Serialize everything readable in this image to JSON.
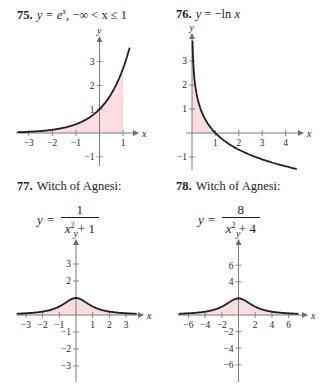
{
  "problems": [
    {
      "number": "75.",
      "title": "y = e^x,  −∞ < x ≤ 1",
      "title_parts": {
        "lhs": "y = e",
        "sup": "x",
        "rest": ",   −∞ < x ≤ 1"
      }
    },
    {
      "number": "76.",
      "title": "y = −ln x",
      "title_parts": {
        "lhs": "y",
        "rest": " = −ln ",
        "var": "x"
      }
    },
    {
      "number": "77.",
      "title": "Witch of Agnesi:",
      "formula": {
        "lhs": "y =",
        "numerator": "1",
        "denominator_var": "x",
        "denominator_rest": " + 1"
      }
    },
    {
      "number": "78.",
      "title": "Witch of Agnesi:",
      "formula": {
        "lhs": "y =",
        "numerator": "8",
        "denominator_var": "x",
        "denominator_rest": " + 4"
      }
    }
  ],
  "axis_labels": {
    "x": "x",
    "y": "y"
  },
  "colors": {
    "curve": "#231f20",
    "shade": "#f9dde0",
    "axis": "#6d6e71"
  },
  "chart_data": [
    {
      "type": "line",
      "title": "75. y = e^x, −∞ < x ≤ 1",
      "function": "exp(x)",
      "xlabel": "x",
      "ylabel": "y",
      "x_ticks": [
        -3,
        -2,
        -1,
        1
      ],
      "y_ticks": [
        -1,
        1,
        2,
        3
      ],
      "xlim": [
        -3.5,
        1.4
      ],
      "ylim": [
        -1.5,
        3.8
      ],
      "shaded_region": {
        "from_x": "-inf",
        "to_x": 1,
        "between": "curve and x-axis"
      },
      "curve_x_range": [
        -3.4,
        1.25
      ],
      "grid": false
    },
    {
      "type": "line",
      "title": "76. y = −ln x",
      "function": "-ln(x)",
      "xlabel": "x",
      "ylabel": "y",
      "x_ticks": [
        1,
        2,
        3,
        4
      ],
      "y_ticks": [
        -1,
        1,
        2,
        3
      ],
      "xlim": [
        0,
        4.7
      ],
      "ylim": [
        -1.6,
        3.8
      ],
      "shaded_region": {
        "from_x": 0,
        "to_x": 1,
        "between": "curve and x-axis"
      },
      "curve_x_range": [
        0.025,
        4.5
      ],
      "grid": false
    },
    {
      "type": "line",
      "title": "77. Witch of Agnesi: y = 1/(x^2 + 1)",
      "function": "1/(x^2+1)",
      "xlabel": "x",
      "ylabel": "y",
      "x_ticks": [
        -3,
        -2,
        -1,
        1,
        2,
        3
      ],
      "y_ticks": [
        -3,
        -2,
        -1,
        2,
        3
      ],
      "xlim": [
        -3.5,
        3.8
      ],
      "ylim": [
        -3.5,
        3.8
      ],
      "peak": {
        "x": 0,
        "y": 1
      },
      "shaded_region": {
        "from_x": "-inf",
        "to_x": "inf",
        "between": "curve and x-axis"
      },
      "grid": false
    },
    {
      "type": "line",
      "title": "78. Witch of Agnesi: y = 8/(x^2 + 4)",
      "function": "8/(x^2+4)",
      "xlabel": "x",
      "ylabel": "y",
      "x_ticks": [
        -6,
        -4,
        -2,
        2,
        4,
        6
      ],
      "y_ticks": [
        -6,
        -4,
        -2,
        4,
        6
      ],
      "xlim": [
        -7,
        7.5
      ],
      "ylim": [
        -7,
        7.8
      ],
      "peak": {
        "x": 0,
        "y": 2
      },
      "shaded_region": {
        "from_x": "-inf",
        "to_x": "inf",
        "between": "curve and x-axis"
      },
      "grid": false
    }
  ]
}
